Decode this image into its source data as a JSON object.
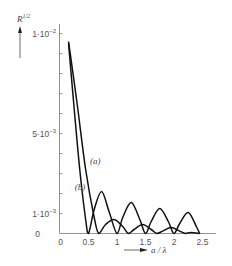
{
  "chart_data": {
    "type": "line",
    "title": "",
    "ylabel": "R 1/2",
    "ylabel_base": "R",
    "ylabel_sup": "1/2",
    "xlabel": "a / λ",
    "xlim": [
      0,
      2.6
    ],
    "ylim": [
      0,
      0.0105
    ],
    "grid": false,
    "legend": "inline labels (a), (b)",
    "x_ticks": [
      {
        "value": 0,
        "label": "0"
      },
      {
        "value": 0.5,
        "label": "0.5"
      },
      {
        "value": 1,
        "label": "1"
      },
      {
        "value": 1.5,
        "label": "1.5"
      },
      {
        "value": 2,
        "label": "2"
      },
      {
        "value": 2.5,
        "label": "2.5"
      }
    ],
    "y_ticks": [
      {
        "value": 0.01,
        "label_base": "1·10",
        "label_exp": "−2"
      },
      {
        "value": 0.005,
        "label_base": "5·10",
        "label_exp": "−3"
      },
      {
        "value": 0.001,
        "label_base": "1·10",
        "label_exp": "−3"
      },
      {
        "value": 0,
        "label_base": "0",
        "label_exp": ""
      }
    ],
    "y_minor_tick_step": 0.001,
    "series": [
      {
        "name": "(a)",
        "x": [
          0.15,
          0.3,
          0.45,
          0.6,
          0.68,
          0.8,
          0.95,
          1.1,
          1.2,
          1.3,
          1.45,
          1.6,
          1.7,
          1.8,
          1.95,
          2.1,
          2.2,
          2.3,
          2.45
        ],
        "y": [
          0.0096,
          0.0065,
          0.0032,
          0.0008,
          0.0,
          0.00045,
          0.0007,
          0.00035,
          0.0,
          0.0002,
          0.00045,
          0.0002,
          0.0,
          0.00012,
          0.0003,
          0.00012,
          0.0,
          5e-05,
          0.0
        ]
      },
      {
        "name": "(b)",
        "x": [
          0.15,
          0.25,
          0.35,
          0.45,
          0.5,
          0.6,
          0.73,
          0.86,
          1.0,
          1.1,
          1.25,
          1.4,
          1.5,
          1.6,
          1.75,
          1.9,
          2.0,
          2.1,
          2.25,
          2.4,
          2.45
        ],
        "y": [
          0.0095,
          0.0062,
          0.0031,
          0.0007,
          0.0,
          0.0012,
          0.0021,
          0.0011,
          0.0,
          0.0008,
          0.00155,
          0.0007,
          0.0,
          0.0006,
          0.00125,
          0.0006,
          0.0,
          0.0005,
          0.00105,
          0.0003,
          0.0
        ]
      }
    ],
    "annotations": [
      {
        "text": "(a)",
        "x": 0.62,
        "y": 0.0035
      },
      {
        "text": "(b)",
        "x": 0.35,
        "y": 0.0022
      }
    ]
  }
}
